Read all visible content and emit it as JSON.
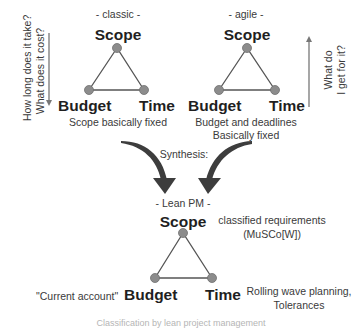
{
  "classic": {
    "title": "- classic -",
    "scope": "Scope",
    "budget": "Budget",
    "time": "Time",
    "caption": "Scope basically fixed",
    "side_note_line1": "How long does it take?",
    "side_note_line2": "What does it cost?"
  },
  "agile": {
    "title": "- agile -",
    "scope": "Scope",
    "budget": "Budget",
    "time": "Time",
    "caption_line1": "Budget and deadlines",
    "caption_line2": "Basically fixed",
    "side_note_line1": "What do",
    "side_note_line2": "I get for it?"
  },
  "synthesis": {
    "label": "Synthesis:"
  },
  "lean": {
    "title": "- Lean PM -",
    "scope": "Scope",
    "budget": "Budget",
    "time": "Time",
    "scope_note_line1": "classified requirements",
    "scope_note_line2": "(MuSCo[W])",
    "budget_note": "\"Current account\"",
    "time_note_line1": "Rolling wave planning,",
    "time_note_line2": "Tolerances"
  },
  "footer": {
    "faint_caption": "Classification by lean project management"
  },
  "colors": {
    "node_fill": "#8c8c8c",
    "line": "#555555",
    "arrow": "#3d3d3d"
  }
}
